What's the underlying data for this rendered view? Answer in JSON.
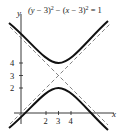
{
  "equation": {
    "text": "(y − 3)² − (x − 3)² = 1",
    "left": "(y − 3)",
    "mid": " − (x − 3)",
    "right": " = 1",
    "exp": "2"
  },
  "axes": {
    "x_label": "x",
    "y_label": "y"
  },
  "x_ticks": [
    "2",
    "3",
    "4"
  ],
  "y_ticks": [
    "4",
    "3",
    "2"
  ],
  "colors": {
    "curve": "#111111",
    "asymptote": "#666666",
    "axis": "#222222"
  }
}
